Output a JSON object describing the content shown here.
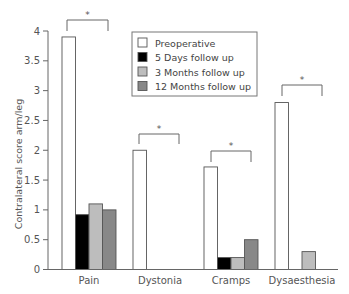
{
  "chart_data": {
    "type": "bar",
    "title": "",
    "xlabel": "",
    "ylabel": "Contralateral score arm/leg",
    "ylim": [
      0,
      4
    ],
    "yticks": [
      0,
      0.5,
      1,
      1.5,
      2,
      2.5,
      3,
      3.5,
      4
    ],
    "ytick_labels": [
      "0",
      "0.5",
      "1",
      "1.5",
      "2",
      "2.5",
      "3",
      "3.5",
      "4"
    ],
    "grid": false,
    "legend_position": "upper center (inside plot)",
    "categories": [
      "Pain",
      "Dystonia",
      "Cramps",
      "Dysaesthesia"
    ],
    "series": [
      {
        "name": "Preoperative",
        "color": "#ffffff",
        "values": [
          3.9,
          2.0,
          1.72,
          2.8
        ]
      },
      {
        "name": "5 Days follow up",
        "color": "#000000",
        "values": [
          0.92,
          0,
          0.2,
          0
        ]
      },
      {
        "name": "3 Months follow up",
        "color": "#bdbdbd",
        "values": [
          1.1,
          0,
          0.2,
          0.3
        ]
      },
      {
        "name": "12 Months follow up",
        "color": "#888888",
        "values": [
          1.0,
          0,
          0.5,
          0
        ]
      }
    ],
    "annotations": [
      {
        "category": "Pain",
        "text": "*",
        "type": "significance-bracket"
      },
      {
        "category": "Dystonia",
        "text": "*",
        "type": "significance-bracket"
      },
      {
        "category": "Cramps",
        "text": "*",
        "type": "significance-bracket"
      },
      {
        "category": "Dysaesthesia",
        "text": "*",
        "type": "significance-bracket"
      }
    ]
  },
  "legend": {
    "items": [
      {
        "label": "Preoperative",
        "color": "#ffffff"
      },
      {
        "label": "5 Days follow up",
        "color": "#000000"
      },
      {
        "label": "3 Months follow up",
        "color": "#bdbdbd"
      },
      {
        "label": "12 Months follow up",
        "color": "#888888"
      }
    ]
  },
  "significance_marker": "*"
}
